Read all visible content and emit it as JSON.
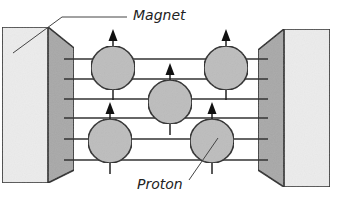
{
  "diagram": {
    "labels": {
      "magnet": "Magnet",
      "proton": "Proton"
    },
    "colors": {
      "magnet_front": "#ececec",
      "magnet_side": "#a8a8a8",
      "proton_fill": "#bdbdbd",
      "stroke": "#222222",
      "field_line": "#333333"
    },
    "field_lines_count": 6,
    "protons": [
      {
        "id": "proton-1",
        "spin": "up"
      },
      {
        "id": "proton-2",
        "spin": "up"
      },
      {
        "id": "proton-3",
        "spin": "up"
      },
      {
        "id": "proton-4",
        "spin": "up"
      },
      {
        "id": "proton-5",
        "spin": "up"
      }
    ]
  }
}
